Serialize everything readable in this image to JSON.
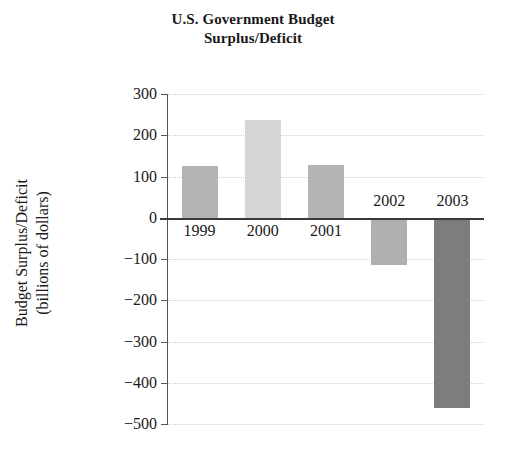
{
  "title": {
    "line1": "U.S. Government Budget",
    "line2": "Surplus/Deficit"
  },
  "axis": {
    "ylabel_line1": "Budget Surplus/Deficit",
    "ylabel_line2": "(billions of dollars)"
  },
  "chart_data": {
    "type": "bar",
    "title": "U.S. Government Budget Surplus/Deficit",
    "xlabel": "",
    "ylabel": "Budget Surplus/Deficit (billions of dollars)",
    "categories": [
      "1999",
      "2000",
      "2001",
      "2002",
      "2003"
    ],
    "values": [
      126,
      237,
      128,
      -115,
      -460
    ],
    "ylim": [
      -500,
      300
    ],
    "yticks": [
      300,
      200,
      100,
      0,
      -100,
      -200,
      -300,
      -400,
      -500
    ],
    "ytick_labels": [
      "300",
      "200",
      "100",
      "0",
      "−100",
      "−200",
      "−300",
      "−400",
      "−500"
    ],
    "bar_colors": [
      "#b3b3b3",
      "#d6d6d6",
      "#b5b5b5",
      "#b0b0b0",
      "#7d7d7d"
    ],
    "grid": "horizontal-dotted",
    "legend": "none"
  }
}
